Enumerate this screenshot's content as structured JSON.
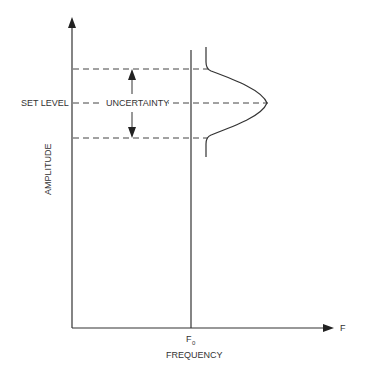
{
  "diagram": {
    "y_axis_label": "AMPLITUDE",
    "x_axis_label": "FREQUENCY",
    "x_axis_end_label": "F",
    "f0_label_main": "F",
    "f0_label_sub": "0",
    "set_level_label": "SET LEVEL",
    "uncertainty_label": "UNCERTAINTY",
    "colors": {
      "line": "#333333",
      "background": "#ffffff"
    }
  }
}
